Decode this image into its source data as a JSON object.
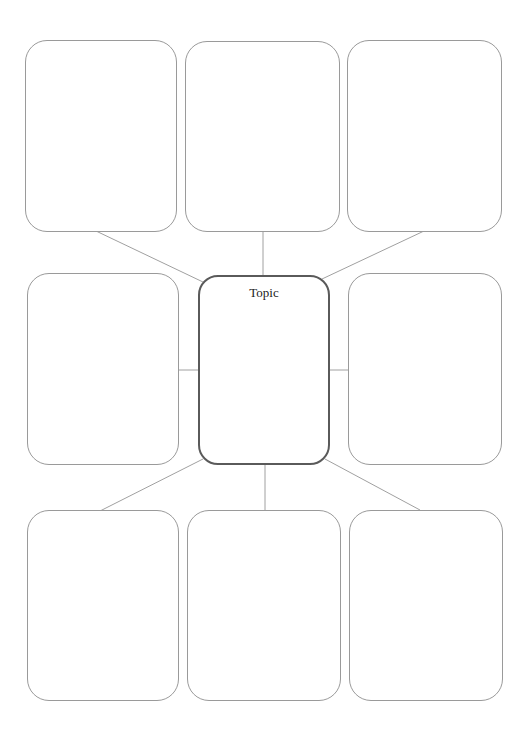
{
  "diagram": {
    "type": "spider-map graphic organizer",
    "center": {
      "label": "Topic",
      "border_color": "#5a5a5a"
    },
    "outer_box_border_color": "#9a9a9a",
    "connector_color": "#a0a0a0",
    "outer_boxes": [
      {
        "position": "top-left",
        "text": ""
      },
      {
        "position": "top-center",
        "text": ""
      },
      {
        "position": "top-right",
        "text": ""
      },
      {
        "position": "middle-left",
        "text": ""
      },
      {
        "position": "middle-right",
        "text": ""
      },
      {
        "position": "bottom-left",
        "text": ""
      },
      {
        "position": "bottom-center",
        "text": ""
      },
      {
        "position": "bottom-right",
        "text": ""
      }
    ]
  }
}
